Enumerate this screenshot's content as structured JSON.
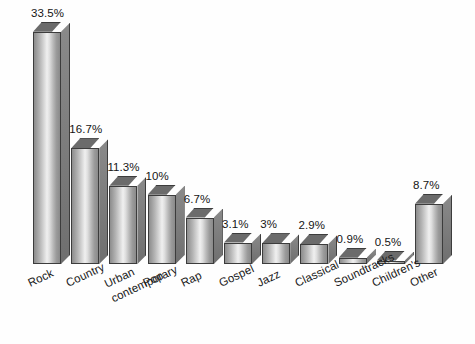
{
  "chart_data": {
    "type": "bar",
    "title": "",
    "subtitle": "",
    "xlabel": "",
    "ylabel": "",
    "ylim": [
      0,
      35
    ],
    "grid": false,
    "legend": false,
    "style": "3d-bar-gray-gradient",
    "categories": [
      "Rock",
      "Country",
      "Urban\ncontemporary",
      "Pop",
      "Rap",
      "Gospel",
      "Jazz",
      "Classical",
      "Soundtracks",
      "Children's",
      "Other"
    ],
    "values": [
      33.5,
      16.7,
      11.3,
      10,
      6.7,
      3.1,
      3,
      2.9,
      0.9,
      0.5,
      8.7
    ],
    "value_labels": [
      "33.5%",
      "16.7%",
      "11.3%",
      "10%",
      "6.7%",
      "3.1%",
      "3%",
      "2.9%",
      "0.9%",
      "0.5%",
      "8.7%"
    ],
    "bar_color": "#b8b8b8",
    "bar_edge_color": "#3c3c3c",
    "bar_side_color": "#7a7a7a",
    "text_color": "#1a1a1a",
    "background_color": "#ffffff",
    "label_rotation_deg": -25
  }
}
